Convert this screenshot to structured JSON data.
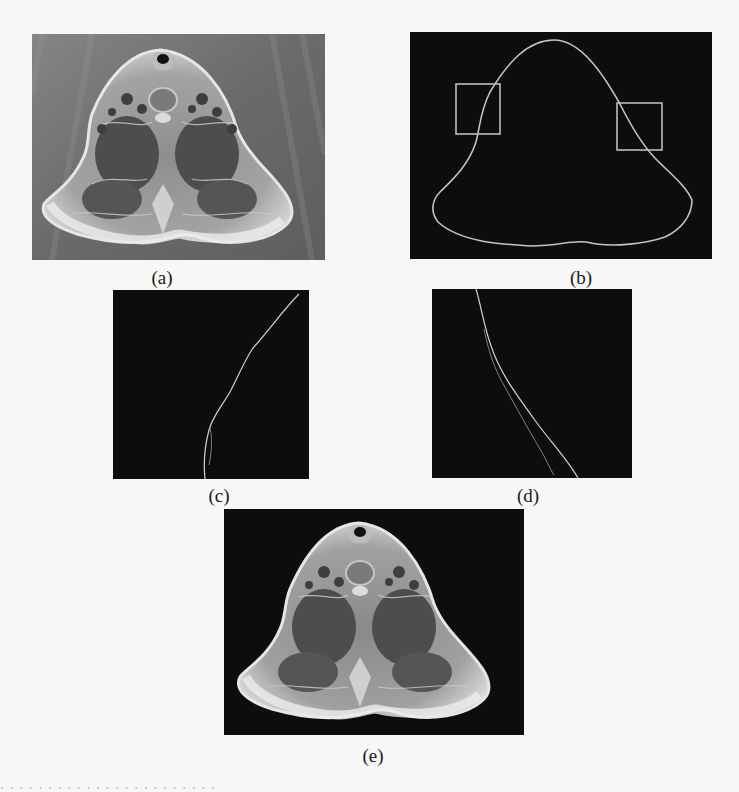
{
  "figure": {
    "panels": [
      {
        "id": "a",
        "label": "(a)",
        "description": "Original axial CT-like image of neck cross-section on gray background"
      },
      {
        "id": "b",
        "label": "(b)",
        "description": "Extracted outer contour on black background with two highlighted regions"
      },
      {
        "id": "c",
        "label": "(c)",
        "description": "Zoomed view of left highlighted contour region"
      },
      {
        "id": "d",
        "label": "(d)",
        "description": "Zoomed view of right highlighted contour region showing double contour"
      },
      {
        "id": "e",
        "label": "(e)",
        "description": "Segmented cross-section with background removed (black)"
      }
    ],
    "colors": {
      "page_background": "#f7f7f6",
      "panel_black": "#0d0d0d",
      "gray_background": "#6e6e6e",
      "contour_line": "#c8c8c8",
      "highlight_box": "#bdbdbd"
    },
    "bottom_partial_text": "· · · · · · · · · · · · · · · · · · · · · · ·"
  }
}
